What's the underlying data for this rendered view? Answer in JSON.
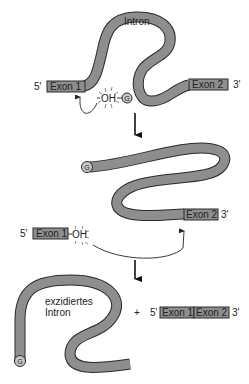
{
  "diagram": {
    "type": "splicing-mechanism",
    "colors": {
      "tube_fill": "#8e8e8e",
      "outline": "#2a2a2a",
      "g_circle": "#c8c8c8",
      "background": "#ffffff"
    },
    "step1": {
      "intron_label": "Intron",
      "exon1_label": "Exon 1",
      "exon2_label": "Exon 2",
      "five_prime": "5'",
      "three_prime": "3'",
      "oh_label": "OH",
      "g_label": "G"
    },
    "step2": {
      "g_label": "G",
      "exon1_label": "Exon 1",
      "exon2_label": "Exon 2",
      "five_prime": "5'",
      "three_prime": "3'",
      "oh_label": "OH"
    },
    "step3": {
      "excised_label_line1": "exzidiertes",
      "excised_label_line2": "Intron",
      "g_label": "G",
      "plus": "+",
      "five_prime": "5'",
      "exon1_label": "Exon 1",
      "exon2_label": "Exon 2",
      "three_prime": "3'"
    }
  }
}
